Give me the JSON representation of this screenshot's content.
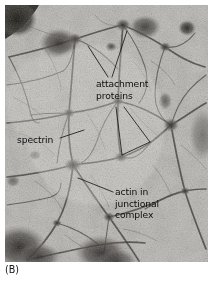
{
  "figure": {
    "panel_label": "(B)",
    "type": "electron micrograph",
    "background_color": "#b9b7b2",
    "text_color": "#0d0d0d",
    "leader_line_color": "#1a1a1a"
  },
  "labels": {
    "attachment_proteins": {
      "line1": "attachment",
      "line2": "proteins"
    },
    "spectrin": {
      "line1": "spectrin"
    },
    "actin": {
      "line1": "actin in",
      "line2": "junctional",
      "line3": "complex"
    }
  }
}
